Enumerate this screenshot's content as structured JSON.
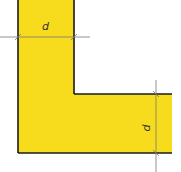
{
  "diagram": {
    "shape": "L-section",
    "fill_color": "#F7DC1E",
    "outline_color": "#1a1a1a",
    "dimension_line_color": "#777777",
    "dimensions": [
      {
        "label": "d",
        "orientation": "horizontal",
        "measures": "width of vertical leg"
      },
      {
        "label": "d",
        "orientation": "vertical",
        "measures": "thickness of horizontal leg"
      }
    ]
  }
}
